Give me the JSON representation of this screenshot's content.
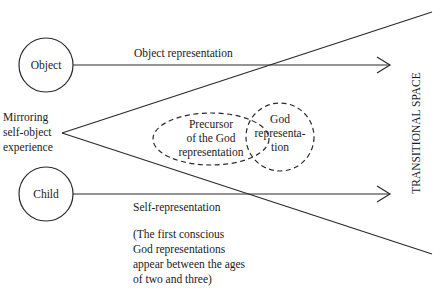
{
  "diagram": {
    "nodes": {
      "object": {
        "label": "Object"
      },
      "child": {
        "label": "Child"
      },
      "origin": {
        "lines": [
          "Mirroring",
          "self-object",
          "experience"
        ]
      },
      "precursor": {
        "lines": [
          "Precursor",
          "of the God",
          "representation"
        ]
      },
      "god": {
        "lines": [
          "God",
          "representa-",
          "tion"
        ]
      }
    },
    "arrows": {
      "object_arrow": {
        "label": "Object representation"
      },
      "child_arrow": {
        "label": "Self-representation"
      }
    },
    "side_label": "TRANSITIONAL SPACE",
    "note": {
      "lines": [
        "(The first conscious",
        "God representations",
        "appear between the ages",
        "of two and three)"
      ]
    }
  }
}
